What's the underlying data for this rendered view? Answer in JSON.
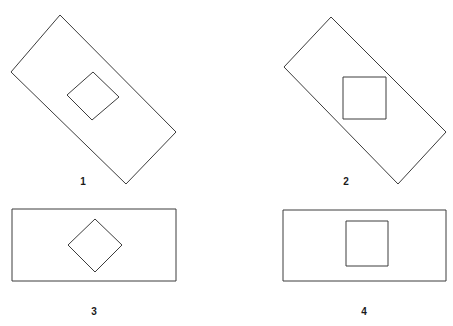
{
  "page": {
    "background_color": "#ffffff",
    "stroke_color": "#3c3c3c",
    "label_color": "#1a1a1a",
    "width": 453,
    "height": 326,
    "header_faint_text": ""
  },
  "figures": [
    {
      "id": "figure-1",
      "label": "1",
      "outer_shape": "rectangle",
      "outer_orientation": "rotated",
      "inner_shape": "square",
      "inner_orientation": "diamond",
      "outer_points": "60,15 176,132 126,184 11,72",
      "inner_points": "93,72 119,97 92,120 67,95"
    },
    {
      "id": "figure-2",
      "label": "2",
      "outer_shape": "rectangle",
      "outer_orientation": "rotated",
      "inner_shape": "square",
      "inner_orientation": "upright",
      "outer_points": "331,17 446,132 398,184 284,67",
      "inner_points": "343,77 386,77 386,119 343,119"
    },
    {
      "id": "figure-3",
      "label": "3",
      "outer_shape": "rectangle",
      "outer_orientation": "upright",
      "inner_shape": "square",
      "inner_orientation": "diamond",
      "outer_points": "12,209 176,209 176,281 12,281",
      "inner_points": "95,219 122,245 95,272 68,245"
    },
    {
      "id": "figure-4",
      "label": "4",
      "outer_shape": "rectangle",
      "outer_orientation": "upright",
      "inner_shape": "square",
      "inner_orientation": "upright",
      "outer_points": "283,210 446,210 446,281 283,281",
      "inner_points": "346,221 388,221 388,266 346,266"
    }
  ]
}
